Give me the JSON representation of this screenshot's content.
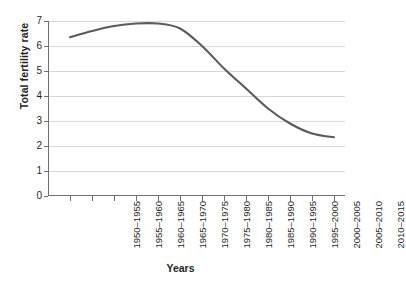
{
  "chart_data": {
    "type": "line",
    "title": "",
    "xlabel": "Years",
    "ylabel": "Total fertility rate",
    "categories": [
      "1950–1955",
      "1955–1960",
      "1960–1965",
      "1965–1970",
      "1970–1975",
      "1975–1980",
      "1980–1985",
      "1985–1990",
      "1990–1995",
      "1995–2000",
      "2000–2005",
      "2005–2010",
      "2010–2015"
    ],
    "values": [
      6.35,
      6.6,
      6.8,
      6.9,
      6.9,
      6.7,
      6.0,
      5.1,
      4.3,
      3.5,
      2.9,
      2.5,
      2.35
    ],
    "series": [
      {
        "name": "Total fertility rate",
        "values": [
          6.35,
          6.6,
          6.8,
          6.9,
          6.9,
          6.7,
          6.0,
          5.1,
          4.3,
          3.5,
          2.9,
          2.5,
          2.35
        ]
      }
    ],
    "ylim": [
      0,
      7
    ],
    "yticks": [
      0,
      1,
      2,
      3,
      4,
      5,
      6,
      7
    ],
    "ytick_labels": [
      "0",
      "1",
      "2",
      "3",
      "4",
      "5",
      "6",
      "7"
    ],
    "grid": true,
    "grid_axis": "y",
    "legend": "none",
    "line_color": "#5a5a5a",
    "grid_color": "#d7d7d7",
    "axis_color": "#6f6f6f",
    "text_color": "#1f1f1f",
    "background": "#ffffff"
  }
}
